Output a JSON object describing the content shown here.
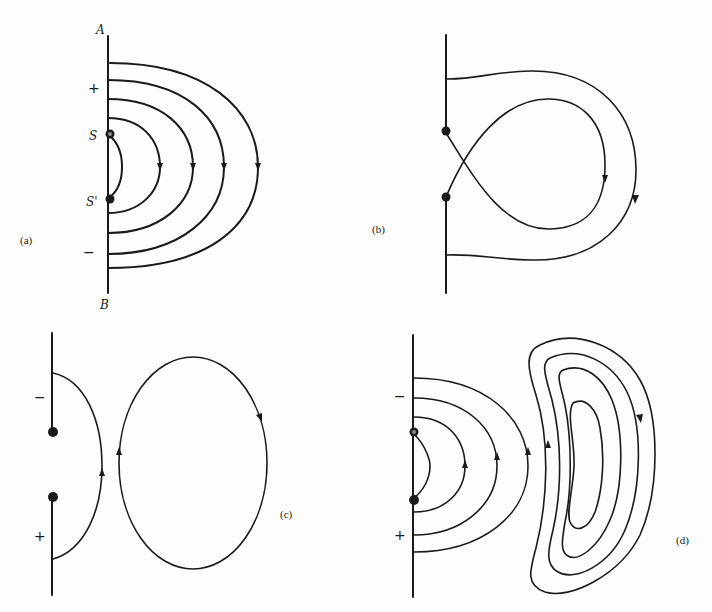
{
  "figure": {
    "panels": [
      {
        "id": "a",
        "label": "(a)",
        "boundary_labels": {
          "top": "A",
          "bottom": "B"
        },
        "source_labels": {
          "upper": "S",
          "lower": "S'"
        },
        "signs": {
          "upper": "+",
          "lower": "−"
        },
        "nested_arcs": 5,
        "arrow_direction": "down"
      },
      {
        "id": "b",
        "label": "(b)",
        "features": [
          "crossing figure-eight loop from sources",
          "outer enclosing line"
        ],
        "arrow_direction": "down"
      },
      {
        "id": "c",
        "label": "(c)",
        "signs": {
          "upper": "−",
          "lower": "+"
        },
        "features": [
          "single arc between sources",
          "detached closed elliptical loop"
        ],
        "arrow_direction": "up-left, clockwise loop"
      },
      {
        "id": "d",
        "label": "(d)",
        "signs": {
          "upper": "−",
          "lower": "+"
        },
        "nested_arcs": 3,
        "closed_crescent_loops": 4,
        "arrow_direction": "up on arcs, clockwise loops"
      }
    ]
  }
}
